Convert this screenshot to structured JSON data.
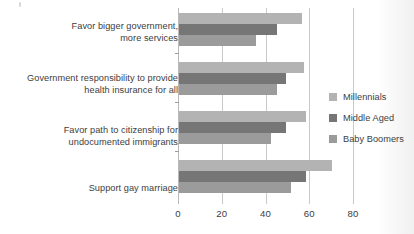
{
  "chart_data": {
    "type": "bar",
    "orientation": "horizontal",
    "title": "",
    "xlabel": "",
    "ylabel": "",
    "xlim": [
      0,
      80
    ],
    "xticks": [
      0,
      20,
      40,
      60,
      80
    ],
    "xtick_labels": [
      "0",
      "20",
      "40",
      "60",
      "80"
    ],
    "grid": true,
    "legend_position": "right",
    "categories": [
      "Favor bigger government,\nmore services",
      "Government responsibility to provide\nhealth insurance for all",
      "Favor path to citizenship for\nundocumented immigrants",
      "Support gay marriage"
    ],
    "series": [
      {
        "name": "Millennials",
        "color": "#b3b3b3",
        "values": [
          56,
          57,
          58,
          70
        ]
      },
      {
        "name": "Middle Aged",
        "color": "#767676",
        "values": [
          45,
          49,
          49,
          58
        ]
      },
      {
        "name": "Baby Boomers",
        "color": "#9b9b9b",
        "values": [
          35,
          45,
          42,
          51
        ]
      }
    ]
  }
}
